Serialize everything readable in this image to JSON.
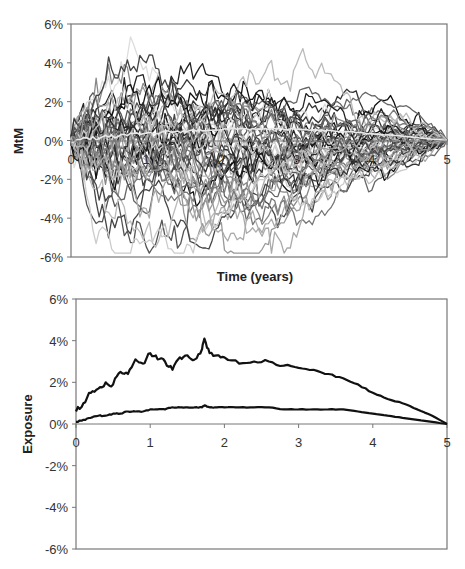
{
  "chart_data": [
    {
      "id": "mtm",
      "type": "line",
      "title": "",
      "xlabel": "Time (years)",
      "ylabel": "MtM",
      "xlim": [
        0,
        5
      ],
      "ylim": [
        -0.06,
        0.06
      ],
      "x_ticks": [
        "0",
        "1",
        "2",
        "3",
        "4",
        "5"
      ],
      "y_ticks": [
        "6%",
        "4%",
        "2%",
        "0%",
        "-2%",
        "-4%",
        "-6%"
      ],
      "grid": false,
      "legend": null,
      "description": "Approximately 50 simulated mark-to-market paths (Brownian-bridge-like), starting near 0% at t=0 and converging to 0% at t=5. Maximum spread about +5.8% (t≈1.6) and -5.3% (t≈1.0).",
      "series_count": 50,
      "envelope": {
        "x": [
          0,
          0.5,
          1,
          1.5,
          2,
          2.5,
          3,
          3.5,
          4,
          4.5,
          5
        ],
        "upper": [
          0.009,
          0.038,
          0.045,
          0.058,
          0.05,
          0.04,
          0.03,
          0.028,
          0.02,
          0.01,
          0
        ],
        "lower": [
          -0.012,
          -0.035,
          -0.053,
          -0.05,
          -0.042,
          -0.04,
          -0.038,
          -0.03,
          -0.025,
          -0.012,
          0
        ]
      }
    },
    {
      "id": "exposure",
      "type": "line",
      "title": "",
      "xlabel": "",
      "ylabel": "Exposure",
      "xlim": [
        0,
        5
      ],
      "ylim": [
        -0.06,
        0.06
      ],
      "x_ticks": [
        "0",
        "1",
        "2",
        "3",
        "4",
        "5"
      ],
      "y_ticks": [
        "6%",
        "4%",
        "2%",
        "0%",
        "-2%",
        "-4%",
        "-6%"
      ],
      "grid": false,
      "legend": null,
      "x": [
        0,
        0.1,
        0.2,
        0.3,
        0.4,
        0.5,
        0.6,
        0.7,
        0.8,
        0.9,
        1.0,
        1.1,
        1.2,
        1.3,
        1.4,
        1.5,
        1.6,
        1.7,
        1.73,
        1.8,
        1.9,
        2.0,
        2.2,
        2.4,
        2.6,
        2.8,
        3.0,
        3.2,
        3.4,
        3.6,
        3.8,
        4.0,
        4.2,
        4.4,
        4.6,
        4.8,
        5.0
      ],
      "series": [
        {
          "name": "Potential future exposure (upper)",
          "color": "#111111",
          "values": [
            0.006,
            0.01,
            0.015,
            0.017,
            0.02,
            0.019,
            0.025,
            0.024,
            0.031,
            0.029,
            0.034,
            0.031,
            0.03,
            0.026,
            0.032,
            0.033,
            0.031,
            0.036,
            0.041,
            0.034,
            0.033,
            0.032,
            0.029,
            0.03,
            0.03,
            0.028,
            0.027,
            0.026,
            0.024,
            0.022,
            0.019,
            0.015,
            0.012,
            0.01,
            0.007,
            0.004,
            0.0
          ]
        },
        {
          "name": "Expected exposure (lower)",
          "color": "#111111",
          "values": [
            0.001,
            0.002,
            0.003,
            0.004,
            0.004,
            0.005,
            0.005,
            0.006,
            0.006,
            0.006,
            0.007,
            0.007,
            0.007,
            0.008,
            0.008,
            0.008,
            0.008,
            0.008,
            0.009,
            0.008,
            0.008,
            0.008,
            0.008,
            0.008,
            0.008,
            0.007,
            0.007,
            0.007,
            0.007,
            0.007,
            0.006,
            0.005,
            0.004,
            0.003,
            0.002,
            0.001,
            0.0
          ]
        }
      ]
    }
  ],
  "labels": {
    "top_ylabel": "MtM",
    "top_xlabel": "Time (years)",
    "bottom_ylabel": "Exposure"
  }
}
